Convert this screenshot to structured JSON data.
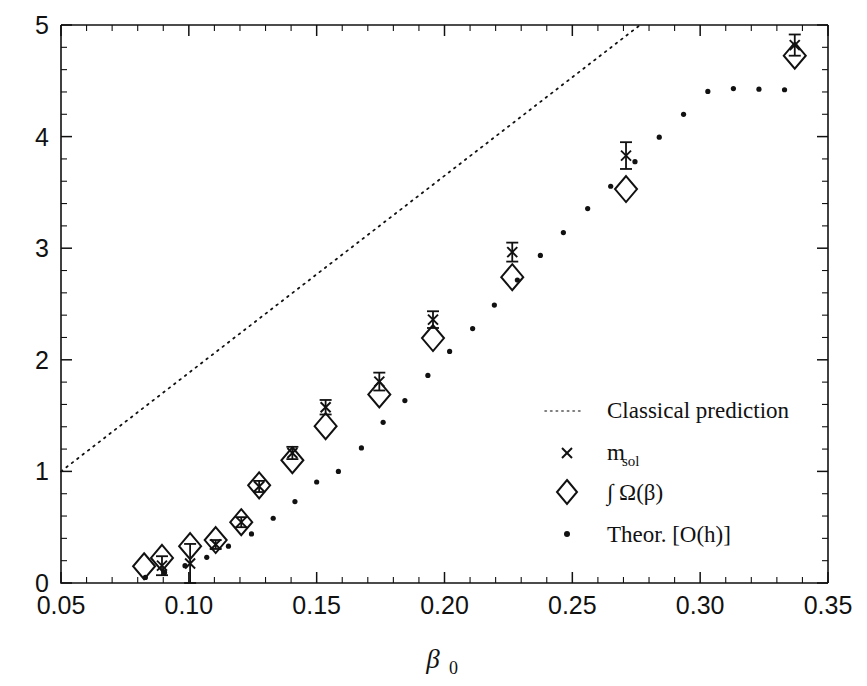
{
  "chart_data": {
    "type": "scatter",
    "title": "",
    "xlabel": "β₀",
    "ylabel": "",
    "xlim": [
      0.05,
      0.35
    ],
    "ylim": [
      0,
      5
    ],
    "grid": false,
    "legend_position": "center-right",
    "x_ticks": [
      "0.05",
      "0.10",
      "0.15",
      "0.20",
      "0.25",
      "0.30",
      "0.35"
    ],
    "x_tick_values": [
      0.05,
      0.1,
      0.15,
      0.2,
      0.25,
      0.3,
      0.35
    ],
    "x_minor_step": 0.01,
    "y_ticks": [
      "0",
      "1",
      "2",
      "3",
      "4",
      "5"
    ],
    "y_tick_values": [
      0,
      1,
      2,
      3,
      4,
      5
    ],
    "y_minor_step": 0.2,
    "series": [
      {
        "name": "Classical prediction",
        "marker": "dotted-line",
        "type": "line",
        "x": [
          0.05,
          0.2765
        ],
        "y": [
          1.0,
          5.0
        ]
      },
      {
        "name": "m_sol",
        "marker": "cross",
        "type": "scatter-errorbar",
        "x": [
          0.0895,
          0.1005,
          0.1105,
          0.1205,
          0.1275,
          0.1405,
          0.1535,
          0.1745,
          0.1955,
          0.2265,
          0.271,
          0.337
        ],
        "y": [
          0.155,
          0.175,
          0.345,
          0.545,
          0.865,
          1.165,
          1.575,
          1.805,
          2.36,
          2.965,
          3.83,
          4.82
        ],
        "yerr": [
          0.085,
          0.175,
          0.04,
          0.045,
          0.05,
          0.055,
          0.065,
          0.08,
          0.075,
          0.085,
          0.12,
          0.095
        ]
      },
      {
        "name": "∫ Ω(β)",
        "marker": "diamond",
        "type": "scatter",
        "x": [
          0.0825,
          0.0895,
          0.1005,
          0.1105,
          0.1205,
          0.1275,
          0.1405,
          0.1535,
          0.1745,
          0.1955,
          0.2265,
          0.271,
          0.337
        ],
        "y": [
          0.15,
          0.225,
          0.33,
          0.385,
          0.545,
          0.875,
          1.1,
          1.405,
          1.69,
          2.195,
          2.74,
          3.53,
          4.725
        ]
      },
      {
        "name": "Theor. [O(h)]",
        "marker": "dot",
        "type": "scatter",
        "x": [
          0.083,
          0.0905,
          0.0985,
          0.107,
          0.1155,
          0.1245,
          0.133,
          0.1415,
          0.15,
          0.1585,
          0.1675,
          0.176,
          0.1845,
          0.1935,
          0.202,
          0.211,
          0.2195,
          0.2285,
          0.2375,
          0.2465,
          0.256,
          0.265,
          0.2745,
          0.284,
          0.2935,
          0.303,
          0.313,
          0.323,
          0.333
        ],
        "y": [
          0.05,
          0.095,
          0.155,
          0.23,
          0.33,
          0.44,
          0.58,
          0.73,
          0.905,
          1.0,
          1.21,
          1.44,
          1.635,
          1.86,
          2.075,
          2.28,
          2.49,
          2.715,
          2.935,
          3.14,
          3.355,
          3.555,
          3.775,
          3.995,
          4.2,
          4.405,
          4.43,
          4.425,
          4.42
        ]
      }
    ]
  },
  "legend": {
    "items": [
      {
        "label": "Classical prediction",
        "marker": "dotted-line"
      },
      {
        "label": "m",
        "sub": "sol",
        "marker": "cross"
      },
      {
        "label": "∫ Ω(β)",
        "marker": "diamond"
      },
      {
        "label": "Theor. [O(h)]",
        "marker": "dot"
      }
    ]
  },
  "axis": {
    "x_title_main": "β",
    "x_title_sub": "0"
  }
}
